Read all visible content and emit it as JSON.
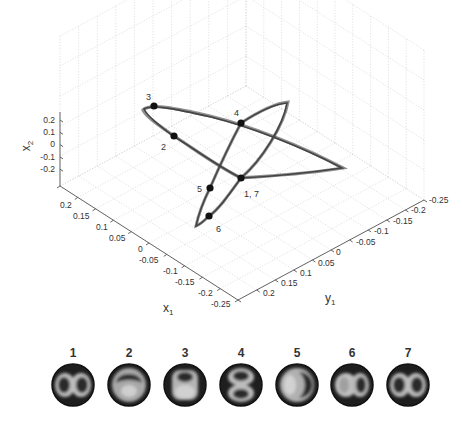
{
  "chart_data": {
    "type": "scatter",
    "subtype": "3d-line-trajectory",
    "title": "",
    "axes": {
      "x": {
        "label": "x",
        "sub": "1",
        "ticks": [
          "0.2",
          "0.15",
          "0.1",
          "0.05",
          "0",
          "-0.05",
          "-0.1",
          "-0.15",
          "-0.2",
          "-0.25"
        ],
        "range": [
          -0.25,
          0.25
        ]
      },
      "y": {
        "label": "y",
        "sub": "1",
        "ticks": [
          "0.2",
          "0.15",
          "0.1",
          "0.05",
          "0",
          "-0.05",
          "-0.1",
          "-0.15",
          "-0.2",
          "-0.25"
        ],
        "range": [
          -0.25,
          0.25
        ]
      },
      "z": {
        "label": "x",
        "sub": "2",
        "ticks": [
          "0.2",
          "0.1",
          "0",
          "-0.1",
          "-0.2"
        ],
        "range": [
          -0.25,
          0.25
        ]
      }
    },
    "grid": true,
    "legend": null,
    "marked_points": [
      {
        "label": "3",
        "px": [
          154,
          106
        ],
        "label_px": [
          146,
          100
        ]
      },
      {
        "label": "2",
        "px": [
          174,
          136
        ],
        "label_px": [
          161,
          150
        ]
      },
      {
        "label": "4",
        "px": [
          241,
          123
        ],
        "label_px": [
          234,
          116
        ]
      },
      {
        "label": "1, 7",
        "px": [
          241,
          178
        ],
        "label_px": [
          244,
          197
        ]
      },
      {
        "label": "5",
        "px": [
          210,
          188
        ],
        "label_px": [
          197,
          192
        ]
      },
      {
        "label": "6",
        "px": [
          209,
          216
        ],
        "label_px": [
          216,
          232
        ]
      }
    ]
  },
  "mode_images": {
    "labels": [
      "1",
      "2",
      "3",
      "4",
      "5",
      "6",
      "7"
    ],
    "patterns": [
      "two-lobes-horizontal",
      "arc-top",
      "lobe-top-bright-bottom",
      "two-lobes-vertical",
      "crescent-right",
      "bright-left-dark-right",
      "two-lobes-horizontal"
    ]
  }
}
